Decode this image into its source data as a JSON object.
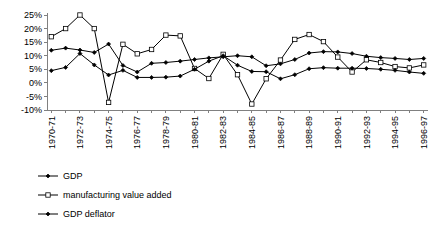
{
  "chart_data": {
    "type": "line",
    "title": "",
    "xlabel": "",
    "ylabel": "",
    "ylim": [
      -10,
      25
    ],
    "ytick_values": [
      25,
      20,
      15,
      10,
      5,
      0,
      -5,
      -10
    ],
    "ytick_labels": [
      "25%",
      "20%",
      "15%",
      "10%",
      "5%",
      "0%",
      "-5%",
      "-10%"
    ],
    "grid": false,
    "legend_position": "bottom-left",
    "categories": [
      "1970-71",
      "1971-72",
      "1972-73",
      "1973-74",
      "1974-75",
      "1975-76",
      "1976-77",
      "1977-78",
      "1978-79",
      "1979-80",
      "1980-81",
      "1981-82",
      "1982-83",
      "1983-84",
      "1984-85",
      "1985-86",
      "1986-87",
      "1987-88",
      "1988-89",
      "1989-90",
      "1990-91",
      "1991-92",
      "1992-93",
      "1993-94",
      "1994-95",
      "1995-96",
      "1996-97"
    ],
    "xtick_labels_shown": [
      "1970-71",
      "1972-73",
      "1974-75",
      "1976-77",
      "1978-79",
      "1980-81",
      "1982-83",
      "1984-85",
      "1986-87",
      "1988-89",
      "1990-91",
      "1992-93",
      "1994-95",
      "1996-97"
    ],
    "series": [
      {
        "name": "GDP",
        "marker": "filled-diamond",
        "values": [
          12.0,
          12.8,
          12.1,
          11.2,
          14.3,
          6.4,
          4.0,
          7.2,
          7.5,
          8.0,
          8.6,
          9.2,
          9.6,
          10.0,
          9.6,
          6.3,
          7.0,
          8.6,
          11.0,
          11.5,
          11.4,
          10.8,
          9.8,
          9.3,
          9.0,
          8.6,
          9.0
        ]
      },
      {
        "name": "manufacturing value added",
        "marker": "open-square",
        "values": [
          17.0,
          20.0,
          25.0,
          20.0,
          -7.2,
          14.2,
          10.7,
          12.3,
          17.6,
          17.3,
          5.3,
          1.6,
          10.5,
          3.0,
          -7.8,
          1.5,
          8.4,
          16.0,
          17.8,
          15.2,
          9.5,
          4.0,
          8.5,
          7.5,
          6.0,
          5.5,
          6.6
        ]
      },
      {
        "name": "GDP deflator",
        "marker": "filled-diamond",
        "values": [
          4.5,
          5.7,
          10.8,
          6.6,
          2.9,
          4.6,
          2.0,
          2.0,
          2.1,
          2.5,
          5.0,
          8.0,
          10.0,
          6.5,
          4.2,
          4.1,
          1.5,
          3.0,
          5.2,
          5.6,
          5.4,
          5.4,
          5.3,
          5.0,
          4.6,
          4.0,
          3.5
        ]
      }
    ],
    "legend": [
      {
        "label": "GDP",
        "marker": "filled-diamond"
      },
      {
        "label": "manufacturing value added",
        "marker": "open-square"
      },
      {
        "label": "GDP deflator",
        "marker": "filled-diamond"
      }
    ]
  }
}
